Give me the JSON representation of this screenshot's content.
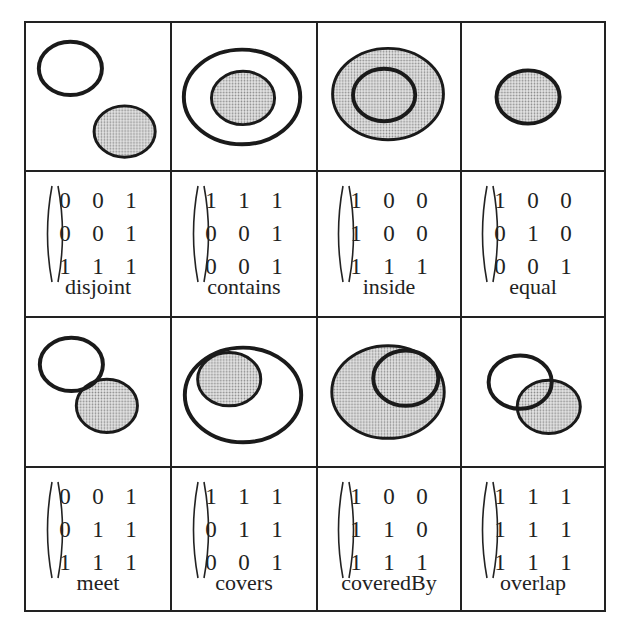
{
  "colors": {
    "stroke": "#1a1a1a",
    "fill_shaded": "#c9c9c9",
    "grid": "#222222",
    "background": "#ffffff"
  },
  "relations": [
    {
      "name": "disjoint",
      "matrix": [
        [
          0,
          0,
          1
        ],
        [
          0,
          0,
          1
        ],
        [
          1,
          1,
          1
        ]
      ]
    },
    {
      "name": "contains",
      "matrix": [
        [
          1,
          1,
          1
        ],
        [
          0,
          0,
          1
        ],
        [
          0,
          0,
          1
        ]
      ]
    },
    {
      "name": "inside",
      "matrix": [
        [
          1,
          0,
          0
        ],
        [
          1,
          0,
          0
        ],
        [
          1,
          1,
          1
        ]
      ]
    },
    {
      "name": "equal",
      "matrix": [
        [
          1,
          0,
          0
        ],
        [
          0,
          1,
          0
        ],
        [
          0,
          0,
          1
        ]
      ]
    },
    {
      "name": "meet",
      "matrix": [
        [
          0,
          0,
          1
        ],
        [
          0,
          1,
          1
        ],
        [
          1,
          1,
          1
        ]
      ]
    },
    {
      "name": "covers",
      "matrix": [
        [
          1,
          1,
          1
        ],
        [
          0,
          1,
          1
        ],
        [
          0,
          0,
          1
        ]
      ]
    },
    {
      "name": "coveredBy",
      "matrix": [
        [
          1,
          0,
          0
        ],
        [
          1,
          1,
          0
        ],
        [
          1,
          1,
          1
        ]
      ]
    },
    {
      "name": "overlap",
      "matrix": [
        [
          1,
          1,
          1
        ],
        [
          1,
          1,
          1
        ],
        [
          1,
          1,
          1
        ]
      ]
    }
  ]
}
